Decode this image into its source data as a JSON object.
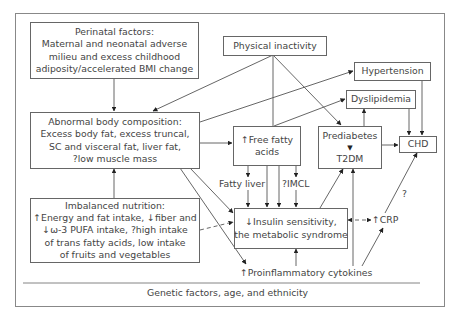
{
  "diagram": {
    "nodes": {
      "perinatal": {
        "title": "Perinatal factors:",
        "lines": [
          "Maternal and neonatal adverse",
          "milieu and excess childhood",
          "adiposity/accelerated BMI change"
        ]
      },
      "physical_inactivity": {
        "label": "Physical inactivity"
      },
      "hypertension": {
        "label": "Hypertension"
      },
      "dyslipidemia": {
        "label": "Dyslipidemia"
      },
      "body_composition": {
        "title": "Abnormal body composition:",
        "lines": [
          "Excess body fat, excess truncal,",
          "SC and visceral fat, liver fat,",
          "?low muscle mass"
        ]
      },
      "free_fatty_acids": {
        "lines": [
          "↑Free fatty",
          "acids"
        ]
      },
      "prediabetes": {
        "top": "Prediabetes",
        "arrow": "▼",
        "bottom": "T2DM"
      },
      "chd": {
        "label": "CHD"
      },
      "imbalanced_nutrition": {
        "title": "Imbalanced nutrition:",
        "lines": [
          "↑Energy and fat intake, ↓fiber and",
          "↓ω-3 PUFA intake, ?high intake",
          "of trans fatty acids, low intake",
          "of fruits and vegetables"
        ]
      },
      "fatty_liver": {
        "label": "Fatty liver"
      },
      "imcl": {
        "label": "?IMCL"
      },
      "insulin_sensitivity": {
        "lines": [
          "↓Insulin sensitivity,",
          "the metabolic syndrome"
        ]
      },
      "crp": {
        "label": "↑CRP"
      },
      "crp_question": {
        "label": "?"
      },
      "cytokines": {
        "label": "↑Proinflammatory cytokines"
      },
      "genetic": {
        "label": "Genetic factors, age, and ethnicity"
      }
    },
    "colors": {
      "line": "#555555",
      "text": "#444444",
      "frame": "#888888"
    }
  }
}
